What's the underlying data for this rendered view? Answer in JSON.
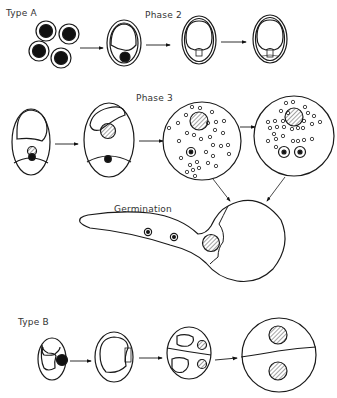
{
  "labels": {
    "type_a": "Type A",
    "phase_2": "Phase 2",
    "phase_3": "Phase 3",
    "germination": "Germination",
    "type_b": "Type B"
  },
  "colors": {
    "ink": "#1a1a1a",
    "background": "#ffffff"
  },
  "stages": {
    "type_a": [
      "four spores",
      "vacuolated cell",
      "phase 2 cell A",
      "phase 2 cell B"
    ],
    "phase_3": [
      "cell with nucleus",
      "cell with hatched nucleus",
      "sphere with granules one nucleus",
      "sphere with granules two nuclei"
    ],
    "germination": [
      "germ tube with nuclei"
    ],
    "type_b": [
      "cell with dark nucleus",
      "cell dividing",
      "two-compartment cell",
      "divided sphere"
    ]
  }
}
